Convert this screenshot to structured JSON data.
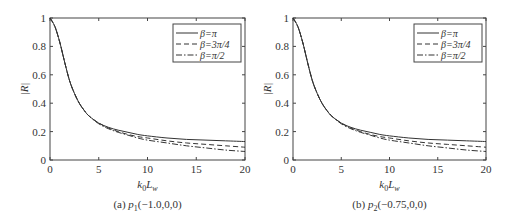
{
  "chart_data": [
    {
      "type": "line",
      "caption": "(a) p1(−1.0,0,0)",
      "caption_prefix": "(a) ",
      "caption_point": "p",
      "caption_sub": "1",
      "caption_coords": "(−1.0,0,0)",
      "xlabel": "k0Lw",
      "ylabel": "|R|",
      "xlim": [
        0,
        20
      ],
      "ylim": [
        0,
        1
      ],
      "xticks": [
        0,
        5,
        10,
        15,
        20
      ],
      "yticks": [
        0,
        0.2,
        0.4,
        0.6,
        0.8,
        1
      ],
      "legend_position": "upper right",
      "x": [
        0,
        0.5,
        1,
        1.5,
        2,
        2.5,
        3,
        3.5,
        4,
        5,
        6,
        7,
        8,
        9,
        10,
        12,
        14,
        16,
        18,
        20
      ],
      "series": [
        {
          "name": "β=π",
          "style": "solid",
          "values": [
            1.0,
            0.94,
            0.83,
            0.69,
            0.56,
            0.47,
            0.4,
            0.35,
            0.31,
            0.26,
            0.23,
            0.21,
            0.195,
            0.18,
            0.17,
            0.155,
            0.145,
            0.14,
            0.135,
            0.13
          ]
        },
        {
          "name": "β=3π/4",
          "style": "dashed",
          "values": [
            1.0,
            0.94,
            0.83,
            0.69,
            0.56,
            0.47,
            0.4,
            0.35,
            0.31,
            0.26,
            0.225,
            0.2,
            0.18,
            0.165,
            0.155,
            0.135,
            0.12,
            0.11,
            0.1,
            0.09
          ]
        },
        {
          "name": "β=π/2",
          "style": "dashdot",
          "values": [
            1.0,
            0.94,
            0.83,
            0.69,
            0.56,
            0.47,
            0.4,
            0.35,
            0.31,
            0.255,
            0.22,
            0.195,
            0.175,
            0.155,
            0.14,
            0.12,
            0.1,
            0.085,
            0.07,
            0.06
          ]
        }
      ]
    },
    {
      "type": "line",
      "caption": "(b) p2(−0.75,0,0)",
      "caption_prefix": "(b) ",
      "caption_point": "p",
      "caption_sub": "2",
      "caption_coords": "(−0.75,0,0)",
      "xlabel": "k0Lw",
      "ylabel": "|R|",
      "xlim": [
        0,
        20
      ],
      "ylim": [
        0,
        1
      ],
      "xticks": [
        0,
        5,
        10,
        15,
        20
      ],
      "yticks": [
        0,
        0.2,
        0.4,
        0.6,
        0.8,
        1
      ],
      "legend_position": "upper right",
      "x": [
        0,
        0.5,
        1,
        1.5,
        2,
        2.5,
        3,
        3.5,
        4,
        5,
        6,
        7,
        8,
        9,
        10,
        12,
        14,
        16,
        18,
        20
      ],
      "series": [
        {
          "name": "β=π",
          "style": "solid",
          "values": [
            1.0,
            0.94,
            0.83,
            0.69,
            0.56,
            0.47,
            0.4,
            0.35,
            0.31,
            0.26,
            0.23,
            0.21,
            0.195,
            0.18,
            0.17,
            0.155,
            0.145,
            0.14,
            0.135,
            0.13
          ]
        },
        {
          "name": "β=3π/4",
          "style": "dashed",
          "values": [
            1.0,
            0.94,
            0.83,
            0.69,
            0.56,
            0.47,
            0.4,
            0.35,
            0.31,
            0.26,
            0.225,
            0.2,
            0.18,
            0.165,
            0.155,
            0.135,
            0.12,
            0.11,
            0.1,
            0.09
          ]
        },
        {
          "name": "β=π/2",
          "style": "dashdot",
          "values": [
            1.0,
            0.94,
            0.83,
            0.69,
            0.56,
            0.47,
            0.4,
            0.35,
            0.31,
            0.255,
            0.22,
            0.195,
            0.175,
            0.155,
            0.14,
            0.12,
            0.1,
            0.085,
            0.07,
            0.06
          ]
        }
      ]
    }
  ],
  "labels": {
    "xlabel_main": "k",
    "xlabel_sub": "0",
    "xlabel_main2": "L",
    "xlabel_sub2": "w",
    "ylabel": "|R|"
  }
}
